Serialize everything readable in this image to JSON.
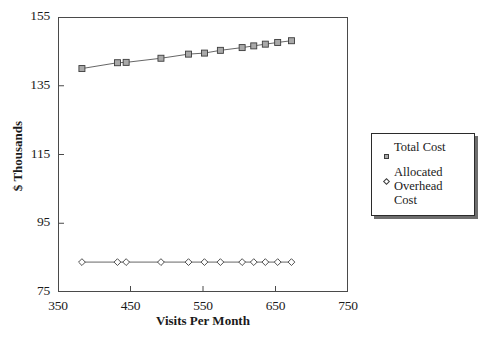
{
  "chart_data": {
    "type": "line",
    "title": "",
    "xlabel": "Visits Per Month",
    "ylabel": "$ Thousands",
    "xlim": [
      350,
      750
    ],
    "ylim": [
      75,
      155
    ],
    "xticks": [
      350,
      450,
      550,
      650,
      750
    ],
    "yticks": [
      75,
      95,
      115,
      135,
      155
    ],
    "grid": false,
    "legend_position": "right-outside",
    "x": [
      383,
      432,
      444,
      492,
      530,
      552,
      574,
      604,
      620,
      636,
      653,
      672
    ],
    "series": [
      {
        "name": "Total Cost",
        "marker": "square",
        "values": [
          140.0,
          141.7,
          141.8,
          143.0,
          144.2,
          144.5,
          145.3,
          146.1,
          146.6,
          147.1,
          147.6,
          148.1
        ]
      },
      {
        "name": "Allocated Overhead Cost",
        "marker": "diamond",
        "values": [
          83.7,
          83.7,
          83.7,
          83.7,
          83.7,
          83.7,
          83.7,
          83.7,
          83.7,
          83.7,
          83.7,
          83.7
        ]
      }
    ]
  },
  "legend": {
    "entries": [
      {
        "label": "Total Cost",
        "marker": "square-marker"
      },
      {
        "label": "Allocated Overhead Cost",
        "marker": "diamond-marker"
      }
    ]
  },
  "axes": {
    "y_tick_labels": [
      "155",
      "135",
      "115",
      "95",
      "75"
    ],
    "x_tick_labels": [
      "350",
      "450",
      "550",
      "650",
      "750"
    ],
    "y_axis_title": "$ Thousands",
    "x_axis_title": "Visits Per Month"
  },
  "colors": {
    "axis": "#4a4a4a",
    "line": "#555555",
    "square_fill": "#a9a9a9",
    "diamond_fill": "#ffffff",
    "marker_stroke": "#3c3c3c",
    "text": "#1a1a1a"
  },
  "footer": {
    "cut_text": ""
  }
}
